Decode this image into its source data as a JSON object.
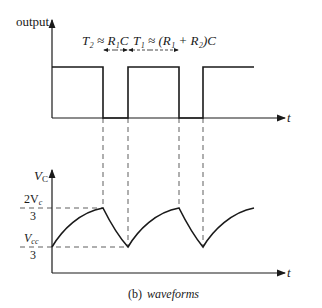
{
  "figure": {
    "caption_prefix": "(b)",
    "caption_title": "waveforms"
  },
  "top_plot": {
    "y_label": "output",
    "x_label": "t",
    "annotation_t2": "T₂ ≈ R₁C",
    "annotation_t1": "T₁ ≈ (R₁ + R₂)C",
    "signal": "square wave (high, low, high, low, high)"
  },
  "bottom_plot": {
    "y_label": "V",
    "y_label_sub": "C",
    "x_label": "t",
    "upper_level_num": "2V",
    "upper_level_num_sub": "c",
    "upper_level_den": "3",
    "lower_level_num": "V",
    "lower_level_num_sub": "cc",
    "lower_level_den": "3",
    "signal": "capacitor voltage charging/discharging between Vcc/3 and 2Vcc/3"
  },
  "colors": {
    "ink": "#1a1a1a",
    "background": "#ffffff"
  }
}
